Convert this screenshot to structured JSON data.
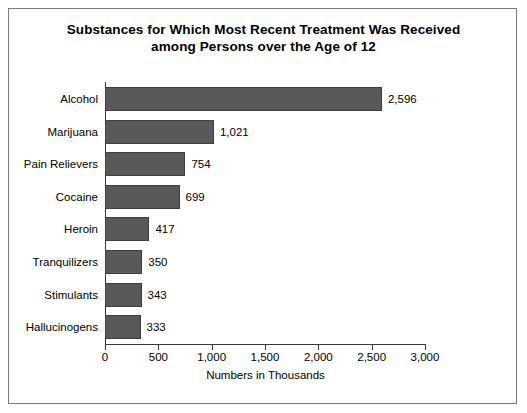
{
  "chart_data": {
    "type": "bar",
    "orientation": "horizontal",
    "title": "Substances for Which Most Recent Treatment Was Received among Persons over the Age of 12",
    "title_line1": "Substances for Which Most Recent Treatment Was Received",
    "title_line2": "among Persons over the Age of 12",
    "categories": [
      "Alcohol",
      "Marijuana",
      "Pain Relievers",
      "Cocaine",
      "Heroin",
      "Tranquilizers",
      "Stimulants",
      "Hallucinogens"
    ],
    "values": [
      2596,
      1021,
      754,
      699,
      417,
      350,
      343,
      333
    ],
    "value_labels": [
      "2,596",
      "1,021",
      "754",
      "699",
      "417",
      "350",
      "343",
      "333"
    ],
    "xlabel": "Numbers in Thousands",
    "ylabel": "",
    "xlim": [
      0,
      3000
    ],
    "xticks": [
      0,
      500,
      1000,
      1500,
      2000,
      2500,
      3000
    ],
    "xtick_labels": [
      "0",
      "500",
      "1,000",
      "1,500",
      "2,000",
      "2,500",
      "3,000"
    ],
    "grid": false,
    "legend": false,
    "bar_color": "#595959",
    "bar_border_color": "#3f3f3f",
    "axis_color": "#3a3a3a",
    "background_color": "#ffffff",
    "frame_color": "#7a7a7a"
  }
}
